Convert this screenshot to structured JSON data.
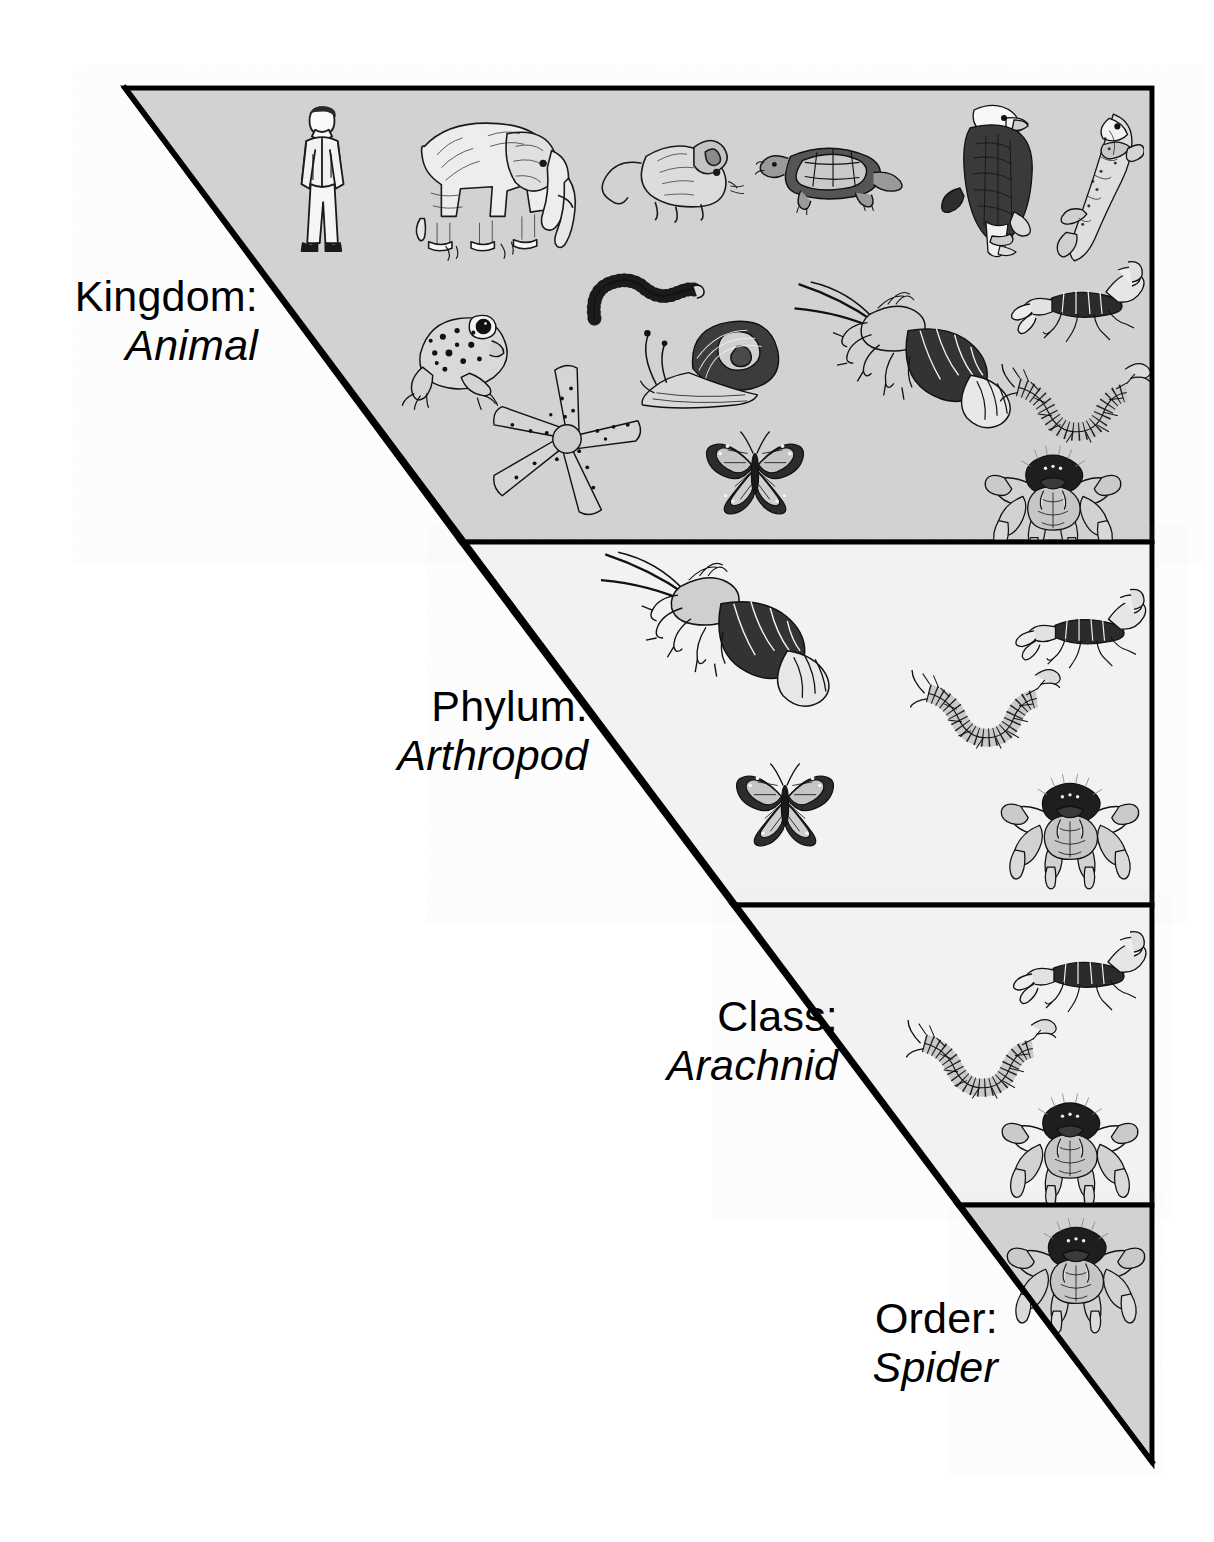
{
  "figure": {
    "colors": {
      "band_gray": "#d2d2d2",
      "band_light": "#f2f2f2",
      "outline": "#000000",
      "page_background": "#ffffff"
    }
  },
  "levels": [
    {
      "id": "kingdom",
      "rank_label": "Kingdom:",
      "taxon_label": "Animal",
      "background": "#d2d2d2",
      "organisms": [
        "human",
        "elephant",
        "mouse",
        "turtle",
        "eagle",
        "fish",
        "earthworm",
        "scorpion",
        "frog",
        "snail",
        "lobster",
        "centipede",
        "starfish",
        "butterfly",
        "tarantula"
      ]
    },
    {
      "id": "phylum",
      "rank_label": "Phylum:",
      "taxon_label": "Arthropod",
      "background": "#f2f2f2",
      "organisms": [
        "lobster",
        "scorpion",
        "centipede",
        "butterfly",
        "tarantula"
      ]
    },
    {
      "id": "class",
      "rank_label": "Class:",
      "taxon_label": "Arachnid",
      "background": "#f2f2f2",
      "organisms": [
        "scorpion",
        "centipede",
        "tarantula"
      ]
    },
    {
      "id": "order",
      "rank_label": "Order:",
      "taxon_label": "Spider",
      "background": "#d2d2d2",
      "organisms": [
        "tarantula"
      ]
    }
  ]
}
